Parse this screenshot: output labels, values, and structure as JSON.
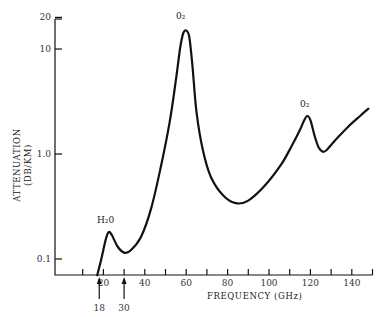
{
  "chart_data": {
    "type": "line",
    "title": "",
    "xlabel": "FREQUENCY (GHz)",
    "ylabel": "ATTENUATION",
    "ylabel_units": "(DB/KM)",
    "yscale": "log",
    "xlim": [
      10,
      150
    ],
    "ylim": [
      0.07,
      20
    ],
    "x_ticks": [
      20,
      40,
      60,
      80,
      100,
      120,
      140
    ],
    "x_minor_ticks": [
      10,
      30,
      50,
      70,
      90,
      110,
      130,
      150
    ],
    "y_ticks": [
      {
        "value": 20,
        "label": "20"
      },
      {
        "value": 10,
        "label": "10"
      },
      {
        "value": 1.0,
        "label": "1.0"
      },
      {
        "value": 0.1,
        "label": "0.1"
      }
    ],
    "grid": false,
    "series": [
      {
        "name": "Atmospheric attenuation",
        "x": [
          17,
          19,
          21,
          22.5,
          24,
          27,
          30,
          33,
          38,
          43,
          48,
          52,
          55,
          57,
          58.5,
          60,
          61.5,
          63,
          65,
          68,
          72,
          78,
          84,
          90,
          98,
          106,
          111,
          115,
          117,
          118.5,
          120,
          122,
          124,
          126,
          128,
          132,
          138,
          144,
          148
        ],
        "y": [
          0.07,
          0.1,
          0.15,
          0.18,
          0.17,
          0.13,
          0.115,
          0.12,
          0.16,
          0.3,
          0.8,
          2.0,
          5.0,
          10,
          14,
          15,
          13,
          7,
          2.5,
          1.1,
          0.6,
          0.4,
          0.34,
          0.36,
          0.5,
          0.8,
          1.2,
          1.7,
          2.1,
          2.3,
          2.1,
          1.5,
          1.15,
          1.05,
          1.1,
          1.35,
          1.8,
          2.3,
          2.7
        ]
      }
    ],
    "annotations": [
      {
        "text": "H2O",
        "x": 22,
        "y": 0.25,
        "label": "H₂0"
      },
      {
        "text": "O2",
        "x": 60,
        "y": 22,
        "label": "0₂"
      },
      {
        "text": "O2",
        "x": 118,
        "y": 3.2,
        "label": "0₂"
      }
    ],
    "markers": [
      {
        "x": 18,
        "label": "18",
        "type": "arrow-up"
      },
      {
        "x": 30,
        "label": "30",
        "type": "arrow-up"
      }
    ]
  },
  "labels": {
    "ylabel_line1": "ATTENUATION",
    "ylabel_line2": "(DB/KM)",
    "xlabel": "FREQUENCY (GHz)",
    "peak_h2o": "H₂0",
    "peak_o2_60": "0₂",
    "peak_o2_118": "0₂",
    "marker_18": "18",
    "marker_30": "30"
  }
}
